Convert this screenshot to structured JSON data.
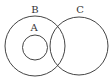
{
  "diagram": {
    "type": "venn",
    "sets": [
      {
        "label": "B",
        "cx": 35,
        "cy": 46,
        "r": 30,
        "label_x": 35,
        "label_y": 13
      },
      {
        "label": "A",
        "cx": 35,
        "cy": 47.5,
        "r": 12.5,
        "label_x": 34,
        "label_y": 31
      },
      {
        "label": "C",
        "cx": 79,
        "cy": 46,
        "r": 29,
        "label_x": 80,
        "label_y": 13
      }
    ],
    "relations": [
      "A is a subset of B",
      "B and C intersect"
    ],
    "stroke_color": "#444444",
    "background": "#ffffff"
  }
}
